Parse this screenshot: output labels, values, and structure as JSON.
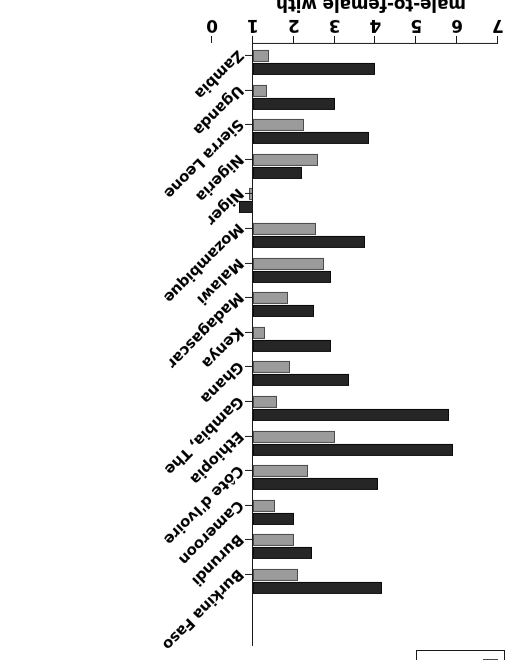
{
  "figure": {
    "orientation_note": "rotated-180",
    "axis_title_lines": [
      "male-to-female with",
      "tertiary education"
    ],
    "legend_label_urban": "urban",
    "legend_label_total": "total"
  },
  "chart_data": {
    "type": "bar",
    "title": "",
    "subtitle": "",
    "xlabel": "",
    "ylabel": "male-to-female with tertiary education",
    "ylim": [
      0,
      7
    ],
    "yticks": [
      0,
      1,
      2,
      3,
      4,
      5,
      6,
      7
    ],
    "ytick_labels": [
      "0",
      "1",
      "2",
      "3",
      "4",
      "5",
      "6",
      "7"
    ],
    "grid": false,
    "baseline": 1,
    "orientation": "horizontal",
    "legend_position": "bottom-right",
    "categories": [
      "Burkina Faso",
      "Burundi",
      "Cameroon",
      "Côte d'Ivoire",
      "Ethiopia",
      "Gambia, The",
      "Ghana",
      "Kenya",
      "Madagascar",
      "Malawi",
      "Mozambique",
      "Niger",
      "Nigeria",
      "Sierra Leone",
      "Uganda",
      "Zambia"
    ],
    "series": [
      {
        "name": "total",
        "color": "#262626",
        "values": [
          4.15,
          2.45,
          2.0,
          4.05,
          5.9,
          5.8,
          3.35,
          2.9,
          2.5,
          2.9,
          3.75,
          0.65,
          2.2,
          3.85,
          3.0,
          4.0
        ]
      },
      {
        "name": "urban",
        "color": "#9b9b9b",
        "values": [
          2.1,
          2.0,
          1.55,
          2.35,
          3.0,
          1.6,
          1.9,
          1.3,
          1.85,
          2.75,
          2.55,
          0.9,
          2.6,
          2.25,
          1.35,
          1.4
        ]
      }
    ]
  }
}
